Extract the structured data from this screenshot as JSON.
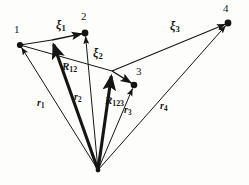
{
  "figure": {
    "background_color": "#fdfdfc",
    "ink_color": "#151515"
  },
  "nodes": [
    {
      "id": "node-1",
      "label": "1",
      "x": 20,
      "y": 45,
      "label_x": 14,
      "label_y": 24
    },
    {
      "id": "node-2",
      "label": "2",
      "x": 85,
      "y": 33,
      "label_x": 81,
      "label_y": 11
    },
    {
      "id": "node-3",
      "label": "3",
      "x": 134,
      "y": 85,
      "label_x": 136,
      "label_y": 66
    },
    {
      "id": "node-4",
      "label": "4",
      "x": 228,
      "y": 23,
      "label_x": 223,
      "label_y": 3
    }
  ],
  "origin": {
    "id": "origin",
    "x": 98,
    "y": 170
  },
  "jacobi_vectors": [
    {
      "id": "xi1",
      "label": "ξ",
      "subscript": "1",
      "from_x": 52,
      "from_y": 40,
      "to_x": 85,
      "to_y": 33,
      "label_x": 56,
      "label_y": 19,
      "weight": "thin"
    },
    {
      "id": "xi2",
      "label": "ξ",
      "subscript": "2",
      "from_x": 112,
      "from_y": 71,
      "to_x": 134,
      "to_y": 85,
      "label_x": 93,
      "label_y": 47,
      "weight": "thin"
    },
    {
      "id": "xi3",
      "label": "ξ",
      "subscript": "3",
      "from_x": 112,
      "from_y": 71,
      "to_x": 228,
      "to_y": 23,
      "label_x": 170,
      "label_y": 20,
      "weight": "thin"
    }
  ],
  "com_vectors": [
    {
      "id": "R12",
      "label": "R",
      "subscript": "12",
      "from_x": 98,
      "from_y": 170,
      "to_x": 52,
      "to_y": 40,
      "label_x": 62,
      "label_y": 61,
      "weight": "thick"
    },
    {
      "id": "R123",
      "label": "R",
      "subscript": "123",
      "from_x": 98,
      "from_y": 170,
      "to_x": 112,
      "to_y": 71,
      "label_x": 105,
      "label_y": 95,
      "weight": "thick"
    }
  ],
  "position_vectors": [
    {
      "id": "r1",
      "label": "r",
      "subscript": "1",
      "from_x": 98,
      "from_y": 170,
      "to_x": 20,
      "to_y": 45,
      "label_x": 37,
      "label_y": 98,
      "weight": "thin"
    },
    {
      "id": "r2",
      "label": "r",
      "subscript": "2",
      "from_x": 98,
      "from_y": 170,
      "to_x": 85,
      "to_y": 33,
      "label_x": 74,
      "label_y": 92,
      "weight": "thin"
    },
    {
      "id": "r3",
      "label": "r",
      "subscript": "3",
      "from_x": 98,
      "from_y": 170,
      "to_x": 134,
      "to_y": 85,
      "label_x": 124,
      "label_y": 105,
      "weight": "thin"
    },
    {
      "id": "r4",
      "label": "r",
      "subscript": "4",
      "from_x": 98,
      "from_y": 170,
      "to_x": 228,
      "to_y": 23,
      "label_x": 160,
      "label_y": 101,
      "weight": "thin"
    }
  ],
  "connector_lines": [
    {
      "id": "line-1-to-xi1-tail",
      "from_x": 20,
      "from_y": 45,
      "to_x": 52,
      "to_y": 40
    },
    {
      "id": "line-xi1tail-to-node2",
      "from_x": 52,
      "from_y": 40,
      "to_x": 85,
      "to_y": 33
    },
    {
      "id": "line-node1-to-R123tip",
      "from_x": 20,
      "from_y": 45,
      "to_x": 112,
      "to_y": 71
    }
  ]
}
